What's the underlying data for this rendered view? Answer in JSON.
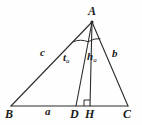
{
  "figure": {
    "kind": "geometry-diagram",
    "background_color": "#fefefe",
    "stroke_color": "#2b2b2b",
    "label_color": "#1a1a1a",
    "canvas": {
      "width": 142,
      "height": 125
    },
    "vertices": [
      {
        "id": "A",
        "label": "A",
        "x": 92,
        "y": 22,
        "label_x": 88,
        "label_y": 6
      },
      {
        "id": "B",
        "label": "B",
        "x": 11,
        "y": 106,
        "label_x": 6,
        "label_y": 109
      },
      {
        "id": "C",
        "label": "C",
        "x": 128,
        "y": 106,
        "label_x": 124,
        "label_y": 109
      }
    ],
    "foot_points": [
      {
        "id": "D",
        "label": "D",
        "x": 76,
        "y": 106,
        "label_x": 71,
        "label_y": 109,
        "meaning": "foot-of-angle-bisector"
      },
      {
        "id": "H",
        "label": "H",
        "x": 90,
        "y": 106,
        "label_x": 85,
        "label_y": 109,
        "meaning": "foot-of-altitude"
      }
    ],
    "segments": [
      {
        "id": "AB",
        "from": "A",
        "to": "B",
        "label": "c",
        "x1": 92,
        "y1": 22,
        "x2": 11,
        "y2": 106
      },
      {
        "id": "AC",
        "from": "A",
        "to": "C",
        "label": "b",
        "x1": 92,
        "y1": 22,
        "x2": 128,
        "y2": 106
      },
      {
        "id": "BC",
        "from": "B",
        "to": "C",
        "label": "a",
        "x1": 11,
        "y1": 106,
        "x2": 128,
        "y2": 106
      },
      {
        "id": "AD",
        "from": "A",
        "to": "D",
        "label": "ta",
        "x1": 92,
        "y1": 22,
        "x2": 76,
        "y2": 106
      },
      {
        "id": "AH",
        "from": "A",
        "to": "H",
        "label": "ha",
        "x1": 92,
        "y1": 22,
        "x2": 90,
        "y2": 106
      }
    ],
    "side_labels": [
      {
        "id": "c",
        "text": "c",
        "x": 41,
        "y": 51
      },
      {
        "id": "b",
        "text": "b",
        "x": 113,
        "y": 52
      },
      {
        "id": "a",
        "text": "a",
        "x": 46,
        "y": 108
      }
    ],
    "cevian_labels": [
      {
        "id": "ta",
        "base": "t",
        "sub": "a",
        "x": 64,
        "y": 55
      },
      {
        "id": "ha",
        "base": "h",
        "sub": "a",
        "x": 88,
        "y": 54
      }
    ],
    "angle_mark": {
      "id": "angle-bisector-arc",
      "at": "A",
      "description": "double arc marking equal bisected angles at A",
      "center_x": 92,
      "center_y": 22,
      "radius": 20
    },
    "right_angle_mark": {
      "id": "right-angle-at-H",
      "at": "H",
      "size": 6,
      "x": 84,
      "y": 100
    }
  }
}
